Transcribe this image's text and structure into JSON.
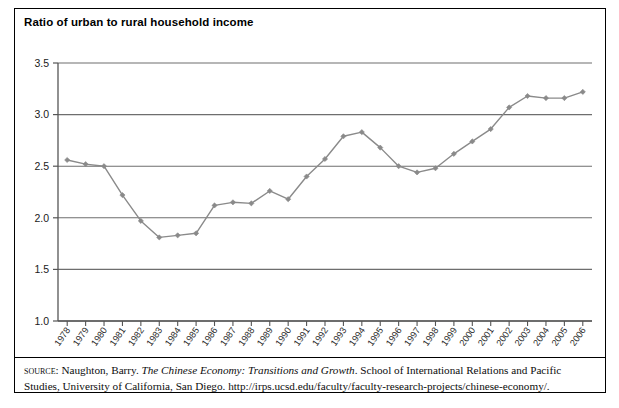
{
  "figure": {
    "title": "Ratio of urban to rural household income",
    "border_color": "#000000",
    "background": "#ffffff"
  },
  "source_note": {
    "label": "source",
    "label_suffix": ": ",
    "author": "Naughton, Barry. ",
    "work_italic": "The Chinese Economy: Transitions and Growth",
    "rest": ". School of International Relations and Pacific Studies, University of California, San Diego. http://irps.ucsd.edu/faculty/faculty-research-projects/chinese-economy/."
  },
  "chart_data": {
    "type": "line",
    "title": "Ratio of urban to rural household income",
    "xlabel": "",
    "ylabel": "",
    "ylim": [
      1.0,
      3.5
    ],
    "ytick_labels": [
      "3.5",
      "3.0",
      "2.5",
      "2.0",
      "1.5",
      "1.0"
    ],
    "ytick_values": [
      3.5,
      3.0,
      2.5,
      2.0,
      1.5,
      1.0
    ],
    "grid": true,
    "grid_color": "#6e6e6e",
    "legend": "none",
    "series_color": "#8a8a8a",
    "marker": "diamond",
    "categories": [
      "1978",
      "1979",
      "1980",
      "1981",
      "1982",
      "1983",
      "1984",
      "1985",
      "1986",
      "1987",
      "1988",
      "1989",
      "1990",
      "1991",
      "1992",
      "1993",
      "1994",
      "1995",
      "1996",
      "1997",
      "1998",
      "1999",
      "2000",
      "2001",
      "2002",
      "2003",
      "2004",
      "2005",
      "2006"
    ],
    "values": [
      2.56,
      2.52,
      2.5,
      2.22,
      1.97,
      1.81,
      1.83,
      1.85,
      2.12,
      2.15,
      2.14,
      2.26,
      2.18,
      2.4,
      2.57,
      2.79,
      2.83,
      2.68,
      2.5,
      2.44,
      2.48,
      2.62,
      2.74,
      2.86,
      3.07,
      3.18,
      3.16,
      3.16,
      3.22
    ],
    "series": [
      {
        "name": "Ratio of urban to rural household income",
        "values": [
          2.56,
          2.52,
          2.5,
          2.22,
          1.97,
          1.81,
          1.83,
          1.85,
          2.12,
          2.15,
          2.14,
          2.26,
          2.18,
          2.4,
          2.57,
          2.79,
          2.83,
          2.68,
          2.5,
          2.44,
          2.48,
          2.62,
          2.74,
          2.86,
          3.07,
          3.18,
          3.16,
          3.16,
          3.22
        ]
      }
    ]
  }
}
